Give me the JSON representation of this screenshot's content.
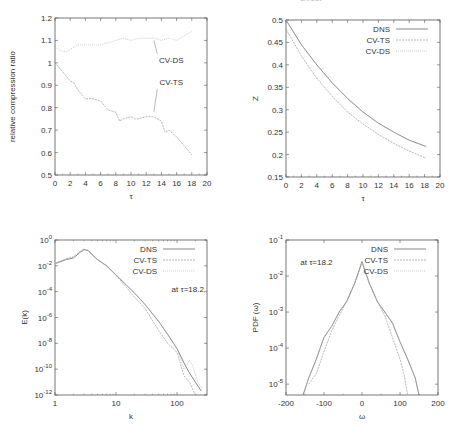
{
  "page_header": {
    "running_title": "— Direct — —— —— ——",
    "page_number": "———"
  },
  "chart_data": [
    {
      "id": "compression",
      "type": "line",
      "title": "",
      "xlabel": "τ",
      "ylabel": "relative compression ratio",
      "xlim": [
        0,
        20
      ],
      "ylim": [
        0.5,
        1.2
      ],
      "xticks": [
        0,
        2,
        4,
        6,
        8,
        10,
        12,
        14,
        16,
        18,
        20
      ],
      "yticks": [
        0.5,
        0.6,
        0.7,
        0.8,
        0.9,
        1,
        1.1,
        1.2
      ],
      "grid": false,
      "legend": null,
      "annotations": [
        {
          "text": "CV-DS",
          "x": 15.3,
          "y": 1.0,
          "arrow_to": [
            13.0,
            1.1
          ]
        },
        {
          "text": "CV-TS",
          "x": 15.3,
          "y": 0.9,
          "arrow_to": [
            13.0,
            0.78
          ]
        }
      ],
      "series": [
        {
          "name": "CV-DS",
          "x": [
            0,
            0.5,
            1,
            1.5,
            2,
            2.5,
            3,
            4,
            5,
            6,
            7,
            8,
            9,
            10,
            11,
            12,
            13,
            14,
            15,
            16,
            17,
            17.5,
            18
          ],
          "y": [
            1.07,
            1.06,
            1.05,
            1.05,
            1.06,
            1.07,
            1.08,
            1.08,
            1.08,
            1.08,
            1.09,
            1.1,
            1.11,
            1.1,
            1.11,
            1.11,
            1.11,
            1.1,
            1.11,
            1.1,
            1.12,
            1.13,
            1.14
          ]
        },
        {
          "name": "CV-TS",
          "x": [
            0,
            0.5,
            1,
            1.5,
            2,
            2.5,
            3,
            4,
            5,
            6,
            7,
            8,
            8.5,
            9,
            10,
            10.5,
            11,
            12,
            13,
            14,
            14.5,
            15,
            16,
            17,
            18
          ],
          "y": [
            1.0,
            0.98,
            0.96,
            0.94,
            0.92,
            0.91,
            0.88,
            0.84,
            0.84,
            0.83,
            0.79,
            0.78,
            0.74,
            0.75,
            0.76,
            0.75,
            0.75,
            0.76,
            0.76,
            0.74,
            0.69,
            0.7,
            0.67,
            0.63,
            0.59
          ]
        }
      ]
    },
    {
      "id": "z",
      "type": "line",
      "title": "",
      "xlabel": "τ",
      "ylabel": "Z",
      "xlim": [
        0,
        20
      ],
      "ylim": [
        0.15,
        0.5
      ],
      "xticks": [
        0,
        2,
        4,
        6,
        8,
        10,
        12,
        14,
        16,
        18,
        20
      ],
      "yticks": [
        0.15,
        0.2,
        0.25,
        0.3,
        0.35,
        0.4,
        0.45,
        0.5
      ],
      "grid": false,
      "legend": {
        "position": "upper right",
        "entries": [
          "DNS",
          "CV-TS",
          "CV-DS"
        ]
      },
      "series": [
        {
          "name": "DNS",
          "x": [
            0,
            2,
            4,
            6,
            8,
            10,
            12,
            14,
            16,
            18.2
          ],
          "y": [
            0.5,
            0.445,
            0.4,
            0.36,
            0.325,
            0.295,
            0.27,
            0.25,
            0.232,
            0.218
          ]
        },
        {
          "name": "CV-TS",
          "x": [
            0,
            2,
            4,
            6,
            8,
            10,
            12,
            14,
            16,
            18.2
          ],
          "y": [
            0.48,
            0.42,
            0.37,
            0.33,
            0.295,
            0.268,
            0.245,
            0.225,
            0.208,
            0.192
          ]
        },
        {
          "name": "CV-DS",
          "x": [
            0,
            2,
            4,
            6,
            8,
            10,
            12,
            14,
            16,
            18.2
          ],
          "y": [
            0.5,
            0.445,
            0.4,
            0.36,
            0.325,
            0.295,
            0.27,
            0.25,
            0.232,
            0.218
          ]
        }
      ]
    },
    {
      "id": "spectrum",
      "type": "line",
      "title": "",
      "xlabel": "k",
      "ylabel": "E(k)",
      "xscale": "log",
      "yscale": "log",
      "xlim": [
        1,
        310
      ],
      "ylim": [
        1e-12,
        1
      ],
      "xticks": [
        1,
        10,
        100
      ],
      "xtick_labels": [
        "1",
        "10",
        "100"
      ],
      "yticks": [
        1e-12,
        1e-10,
        1e-08,
        1e-06,
        0.0001,
        0.01,
        1
      ],
      "ytick_labels": [
        "10^-12",
        "10^-10",
        "10^-8",
        "10^-6",
        "10^-4",
        "10^-2",
        "10^0"
      ],
      "grid": false,
      "legend": {
        "position": "upper right",
        "entries": [
          "DNS",
          "CV-TS",
          "CV-DS"
        ]
      },
      "annotations": [
        {
          "text": "at  τ=18.2",
          "x": 150,
          "y": 0.0001
        }
      ],
      "series": [
        {
          "name": "DNS",
          "x": [
            1,
            1.5,
            2,
            2.5,
            3,
            3.5,
            4,
            5,
            7,
            10,
            15,
            20,
            30,
            50,
            70,
            100,
            130,
            160,
            200,
            250
          ],
          "y": [
            0.015,
            0.03,
            0.04,
            0.1,
            0.18,
            0.15,
            0.08,
            0.03,
            0.01,
            0.002,
            0.0003,
            8e-05,
            1e-05,
            5e-07,
            5e-08,
            4e-09,
            3e-10,
            5e-11,
            1e-11,
            2e-12
          ]
        },
        {
          "name": "CV-TS",
          "x": [
            1,
            1.5,
            2,
            2.5,
            3,
            3.5,
            4,
            5,
            7,
            10,
            15,
            20,
            30,
            50,
            70,
            100,
            130,
            160,
            200
          ],
          "y": [
            0.015,
            0.035,
            0.05,
            0.12,
            0.2,
            0.16,
            0.08,
            0.03,
            0.01,
            0.0018,
            0.0002,
            4e-05,
            5e-06,
            1e-07,
            1e-08,
            2e-09,
            3e-11,
            1e-11,
            1e-12
          ]
        },
        {
          "name": "CV-DS",
          "x": [
            1,
            1.5,
            2,
            2.5,
            3,
            3.5,
            4,
            5,
            7,
            10,
            15,
            20,
            30,
            50,
            70,
            100,
            130,
            160,
            180,
            220,
            260
          ],
          "y": [
            0.015,
            0.03,
            0.05,
            0.1,
            0.17,
            0.15,
            0.08,
            0.03,
            0.01,
            0.002,
            0.0003,
            8e-05,
            1e-05,
            5e-07,
            5e-08,
            4e-09,
            1e-10,
            5e-10,
            2e-10,
            1e-11,
            3e-12
          ]
        }
      ]
    },
    {
      "id": "pdf",
      "type": "line",
      "title": "",
      "xlabel": "ω",
      "ylabel": "PDF (ω)",
      "yscale": "log",
      "xlim": [
        -200,
        200
      ],
      "ylim": [
        5e-06,
        0.1
      ],
      "xticks": [
        -200,
        -100,
        0,
        100,
        200
      ],
      "yticks": [
        1e-05,
        0.0001,
        0.001,
        0.01,
        0.1
      ],
      "ytick_labels": [
        "10^-5",
        "10^-4",
        "10^-3",
        "10^-2",
        "10^-1"
      ],
      "grid": false,
      "legend": {
        "position": "upper right",
        "entries": [
          "DNS",
          "CV-TS",
          "CV-DS"
        ]
      },
      "annotations": [
        {
          "text": "at  τ=18.2",
          "x": -120,
          "y": 0.02
        }
      ],
      "series": [
        {
          "name": "DNS",
          "x": [
            -155,
            -140,
            -120,
            -100,
            -80,
            -60,
            -40,
            -20,
            -10,
            0,
            10,
            20,
            40,
            60,
            80,
            100,
            120,
            140,
            150
          ],
          "y": [
            5e-06,
            1.5e-05,
            5e-05,
            0.0002,
            0.0004,
            0.001,
            0.002,
            0.006,
            0.012,
            0.025,
            0.012,
            0.006,
            0.002,
            0.001,
            0.0005,
            0.00015,
            5e-05,
            1.5e-05,
            5e-06
          ]
        },
        {
          "name": "CV-TS",
          "x": [
            -140,
            -120,
            -100,
            -80,
            -60,
            -40,
            -20,
            -10,
            0,
            10,
            20,
            40,
            60,
            80,
            100,
            110,
            120
          ],
          "y": [
            1e-05,
            2e-05,
            8e-05,
            0.0003,
            0.0008,
            0.002,
            0.006,
            0.012,
            0.025,
            0.012,
            0.006,
            0.002,
            0.0008,
            0.0002,
            5e-05,
            2e-05,
            5e-06
          ]
        },
        {
          "name": "CV-DS",
          "x": [
            -155,
            -140,
            -120,
            -100,
            -80,
            -60,
            -40,
            -20,
            -10,
            0,
            10,
            20,
            40,
            60,
            80,
            100,
            120,
            140,
            150
          ],
          "y": [
            5e-06,
            1.5e-05,
            5e-05,
            0.0002,
            0.0004,
            0.001,
            0.002,
            0.006,
            0.012,
            0.025,
            0.012,
            0.006,
            0.002,
            0.001,
            0.0005,
            0.00015,
            5e-05,
            1.5e-05,
            5e-06
          ]
        }
      ]
    }
  ],
  "styles": {
    "frame_color": "#555555",
    "text_color": "#333333",
    "series_colors": {
      "DNS": "#555555",
      "CV-TS": "#9a9a9a",
      "CV-DS": "#b8b8b8"
    }
  }
}
